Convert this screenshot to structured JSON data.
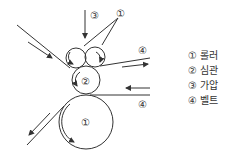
{
  "diagram": {
    "labels": {
      "pressure": "③",
      "roller_top": "①",
      "belt_top": "④",
      "core": "②",
      "belt_right": "④",
      "roller_big": "①"
    },
    "legend": [
      {
        "num": "①",
        "text": "롤러"
      },
      {
        "num": "②",
        "text": "심관"
      },
      {
        "num": "③",
        "text": "가압"
      },
      {
        "num": "④",
        "text": "벨트"
      }
    ],
    "colors": {
      "line": "#333333",
      "background": "#ffffff"
    }
  }
}
